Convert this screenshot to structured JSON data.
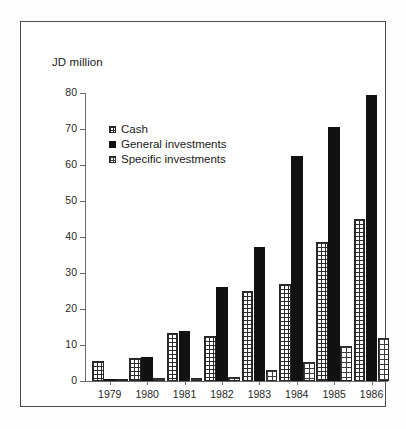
{
  "figure": {
    "axis_title": "JD million",
    "legend": [
      {
        "key": "cash",
        "label": "Cash",
        "swatch": "grid-hatch-swatch"
      },
      {
        "key": "general",
        "label": "General investments",
        "swatch": "solid-black-swatch"
      },
      {
        "key": "specific",
        "label": "Specific investments",
        "swatch": "coarse-grid-swatch"
      }
    ]
  },
  "chart_data": {
    "type": "bar",
    "title": "",
    "subtitle": "",
    "xlabel": "",
    "ylabel": "JD million",
    "ylim": [
      0,
      80
    ],
    "yticks": [
      0,
      10,
      20,
      30,
      40,
      50,
      60,
      70,
      80
    ],
    "ytick_labels": [
      "0",
      "10",
      "20",
      "30",
      "40",
      "50",
      "60",
      "70",
      "80"
    ],
    "grid": false,
    "legend_position": "upper-left-inside",
    "categories": [
      "1979",
      "1980",
      "1981",
      "1982",
      "1983",
      "1984",
      "1985",
      "1986"
    ],
    "series": [
      {
        "name": "Cash",
        "values": [
          5.5,
          6.5,
          13.2,
          12.5,
          25.0,
          27.0,
          38.5,
          45.0
        ]
      },
      {
        "name": "General investments",
        "values": [
          0.5,
          6.6,
          14.0,
          26.2,
          37.2,
          62.5,
          70.5,
          79.5
        ]
      },
      {
        "name": "Specific investments",
        "values": [
          0.2,
          0.7,
          0.7,
          1.0,
          3.0,
          5.3,
          9.8,
          12.0
        ]
      }
    ]
  }
}
